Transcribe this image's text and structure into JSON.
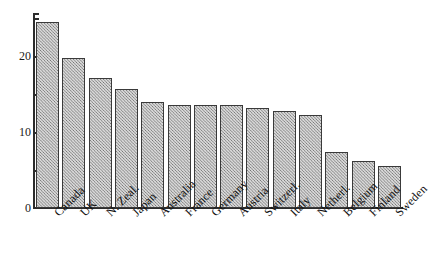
{
  "chart_data": {
    "type": "bar",
    "title": "",
    "subtitle": "",
    "xlabel": "",
    "ylabel": "",
    "categories": [
      "Canada",
      "UK",
      "N. Zeal.",
      "Japan",
      "Australia",
      "France",
      "Germany",
      "Austria",
      "Switzerl.",
      "Italy",
      "Netherl.",
      "Belgium",
      "Finland",
      "Sweden"
    ],
    "values": [
      24.5,
      19.8,
      17.1,
      15.7,
      14.0,
      13.5,
      13.5,
      13.5,
      13.2,
      12.8,
      12.2,
      7.4,
      6.2,
      5.5
    ],
    "ylim": [
      0,
      26
    ],
    "y_ticks_major": [
      0,
      10,
      20
    ],
    "y_tick_labels": [
      "0",
      "10",
      "20"
    ],
    "y_ticks_minor": [
      5,
      15,
      25
    ],
    "grid": false,
    "legend": "none",
    "bar_style": {
      "fill": "#d8d8d8",
      "hatch": "cross-hatch",
      "edge_color": "#3a3a3a"
    },
    "axis_color": "#2c2c2c",
    "background": "#ffffff"
  }
}
